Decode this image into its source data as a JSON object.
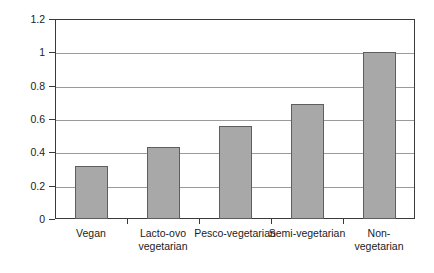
{
  "chart_data": {
    "type": "bar",
    "title": "",
    "xlabel": "",
    "ylabel": "Odds Ratio for Type 2 Diabetes",
    "categories": [
      "Vegan",
      "Lacto-ovo vegetarian",
      "Pesco-vegetarian",
      "Semi-vegetarian",
      "Non-vegetarian"
    ],
    "category_lines": [
      [
        "Vegan"
      ],
      [
        "Lacto-ovo",
        "vegetarian"
      ],
      [
        "Pesco-vegetarian"
      ],
      [
        "Semi-vegetarian"
      ],
      [
        "Non-vegetarian"
      ]
    ],
    "values": [
      0.32,
      0.43,
      0.56,
      0.69,
      1.0
    ],
    "ylim": [
      0,
      1.2
    ],
    "yticks": [
      0,
      0.2,
      0.4,
      0.6,
      0.8,
      1,
      1.2
    ],
    "ytick_labels": [
      "0",
      "0.2",
      "0.4",
      "0.6",
      "0.8",
      "1",
      "1.2"
    ],
    "grid": true,
    "legend": "none",
    "bar_color": "#a8a8a8",
    "bar_border_color": "#5e5e5e",
    "axis_color": "#3a3a3a",
    "gridline_color": "#9a9a9a",
    "background": "#ffffff"
  }
}
